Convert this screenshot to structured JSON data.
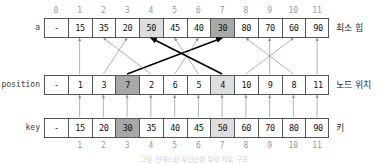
{
  "figure": {
    "caption": "그림 인덱스된 우선순위 큐의 자료 구조"
  },
  "top_index_row": {
    "name": "array-index-top",
    "labels": [
      "0",
      "1",
      "2",
      "3",
      "4",
      "5",
      "6",
      "7",
      "8",
      "9",
      "10",
      "11"
    ]
  },
  "bottom_index_row": {
    "name": "array-index-bottom",
    "labels": [
      "1",
      "2",
      "3",
      "4",
      "5",
      "6",
      "7",
      "8",
      "9",
      "10",
      "11"
    ]
  },
  "rows": [
    {
      "id": "a",
      "left_label": "a",
      "right_label": "최소 힙",
      "cells": [
        "-",
        "15",
        "35",
        "20",
        "50",
        "45",
        "40",
        "30",
        "80",
        "70",
        "60",
        "90"
      ],
      "highlights": {
        "4": "light",
        "7": "dark"
      }
    },
    {
      "id": "position",
      "left_label": "position",
      "right_label": "노드 위치",
      "cells": [
        "-",
        "1",
        "3",
        "7",
        "2",
        "6",
        "5",
        "4",
        "10",
        "9",
        "8",
        "11"
      ],
      "highlights": {
        "3": "dark",
        "7": "light"
      }
    },
    {
      "id": "key",
      "left_label": "key",
      "right_label": "키",
      "cells": [
        "-",
        "15",
        "20",
        "30",
        "35",
        "40",
        "45",
        "50",
        "60",
        "70",
        "80",
        "90"
      ],
      "highlights": {
        "3": "dark",
        "7": "light"
      }
    }
  ],
  "colors": {
    "highlight_dark": "#a8a8a8",
    "highlight_light": "#dedede",
    "border": "#555555",
    "arrow_light": "#9a9a9a",
    "arrow_bold": "#000000",
    "index_text": "#9a9a9a"
  },
  "arrows": {
    "position_to_a": [
      {
        "from_index": 1,
        "to_index": 1,
        "style": "light"
      },
      {
        "from_index": 2,
        "to_index": 3,
        "style": "light"
      },
      {
        "from_index": 3,
        "to_index": 7,
        "style": "bold"
      },
      {
        "from_index": 4,
        "to_index": 2,
        "style": "light"
      },
      {
        "from_index": 5,
        "to_index": 6,
        "style": "light"
      },
      {
        "from_index": 6,
        "to_index": 5,
        "style": "light"
      },
      {
        "from_index": 7,
        "to_index": 4,
        "style": "bold"
      },
      {
        "from_index": 8,
        "to_index": 10,
        "style": "light"
      },
      {
        "from_index": 9,
        "to_index": 9,
        "style": "light"
      },
      {
        "from_index": 10,
        "to_index": 8,
        "style": "light"
      },
      {
        "from_index": 11,
        "to_index": 11,
        "style": "light"
      }
    ],
    "key_to_position": [
      1,
      2,
      3,
      4,
      5,
      6,
      7,
      8,
      9,
      10,
      11
    ]
  }
}
